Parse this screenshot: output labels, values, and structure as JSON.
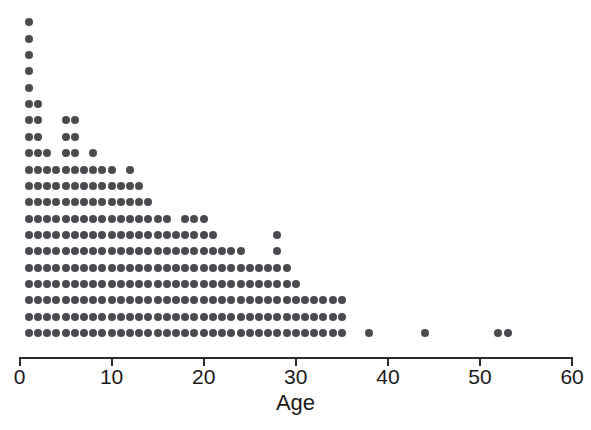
{
  "chart_data": {
    "type": "dotplot",
    "title": "",
    "subtitle": "",
    "xlabel": "Age",
    "ylabel": "",
    "xlim": [
      0,
      60
    ],
    "ylim": [
      0,
      20
    ],
    "xticks": [
      0,
      10,
      20,
      30,
      40,
      50,
      60
    ],
    "xtick_labels": [
      "0",
      "10",
      "20",
      "30",
      "40",
      "50",
      "60"
    ],
    "grid": false,
    "legend": null,
    "annotations": [],
    "dot_color": "#4a4a4f",
    "axis_color": "#2b2b2b",
    "background": "#ffffff",
    "x": [
      1,
      2,
      3,
      4,
      5,
      6,
      7,
      8,
      9,
      10,
      11,
      12,
      13,
      14,
      15,
      16,
      17,
      18,
      19,
      20,
      21,
      22,
      23,
      24,
      25,
      26,
      27,
      28,
      29,
      30,
      31,
      32,
      33,
      34,
      35,
      38,
      44,
      52,
      53
    ],
    "counts": [
      20,
      15,
      12,
      11,
      14,
      14,
      11,
      12,
      11,
      11,
      10,
      11,
      10,
      9,
      8,
      8,
      7,
      8,
      8,
      8,
      7,
      6,
      6,
      6,
      5,
      5,
      5,
      7,
      5,
      4,
      3,
      3,
      3,
      3,
      3,
      1,
      1,
      1,
      1
    ],
    "total_observations": 313,
    "max_count": 20,
    "max_count_age": 1,
    "values": [
      {
        "age": 1,
        "count": 20
      },
      {
        "age": 2,
        "count": 15
      },
      {
        "age": 3,
        "count": 12
      },
      {
        "age": 4,
        "count": 11
      },
      {
        "age": 5,
        "count": 14
      },
      {
        "age": 6,
        "count": 14
      },
      {
        "age": 7,
        "count": 11
      },
      {
        "age": 8,
        "count": 12
      },
      {
        "age": 9,
        "count": 11
      },
      {
        "age": 10,
        "count": 11
      },
      {
        "age": 11,
        "count": 10
      },
      {
        "age": 12,
        "count": 11
      },
      {
        "age": 13,
        "count": 10
      },
      {
        "age": 14,
        "count": 9
      },
      {
        "age": 15,
        "count": 8
      },
      {
        "age": 16,
        "count": 8
      },
      {
        "age": 17,
        "count": 7
      },
      {
        "age": 18,
        "count": 8
      },
      {
        "age": 19,
        "count": 8
      },
      {
        "age": 20,
        "count": 8
      },
      {
        "age": 21,
        "count": 7
      },
      {
        "age": 22,
        "count": 6
      },
      {
        "age": 23,
        "count": 6
      },
      {
        "age": 24,
        "count": 6
      },
      {
        "age": 25,
        "count": 5
      },
      {
        "age": 26,
        "count": 5
      },
      {
        "age": 27,
        "count": 5
      },
      {
        "age": 28,
        "count": 7
      },
      {
        "age": 29,
        "count": 5
      },
      {
        "age": 30,
        "count": 4
      },
      {
        "age": 31,
        "count": 3
      },
      {
        "age": 32,
        "count": 3
      },
      {
        "age": 33,
        "count": 3
      },
      {
        "age": 34,
        "count": 3
      },
      {
        "age": 35,
        "count": 3
      },
      {
        "age": 38,
        "count": 1
      },
      {
        "age": 44,
        "count": 1
      },
      {
        "age": 52,
        "count": 1
      },
      {
        "age": 53,
        "count": 1
      }
    ]
  },
  "geometry": {
    "x_origin_px": 19.5,
    "px_per_unit": 9.21,
    "baseline_y_px": 333,
    "row_pitch_px": 16.35,
    "dot_diameter_px": 8,
    "axis_y_px": 357,
    "tick_height_px": 9,
    "tick_label_y_px": 366,
    "axis_title_y_px": 392
  }
}
